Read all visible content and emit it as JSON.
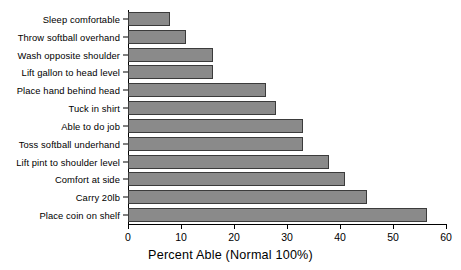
{
  "chart_data": {
    "type": "bar",
    "orientation": "horizontal",
    "title": "",
    "xlabel": "Percent Able (Normal 100%)",
    "ylabel": "",
    "xlim": [
      0,
      60
    ],
    "xticks": [
      0,
      10,
      20,
      30,
      40,
      50,
      60
    ],
    "xtick_labels": [
      "0",
      "10",
      "20",
      "30",
      "40",
      "50",
      "60"
    ],
    "grid": false,
    "legend": null,
    "bar_color": "#8a8a8a",
    "bar_edge_color": "#3b3b3b",
    "categories": [
      "Sleep comfortable",
      "Throw softball overhand",
      "Wash opposite shoulder",
      "Lift gallon to head level",
      "Place hand behind head",
      "Tuck in shirt",
      "Able to do job",
      "Toss softball underhand",
      "Lift pint to shoulder level",
      "Comfort at side",
      "Carry 20lb",
      "Place coin on shelf"
    ],
    "values": [
      8,
      11,
      16,
      16,
      26,
      28,
      33,
      33,
      38,
      41,
      45,
      56.5
    ]
  }
}
